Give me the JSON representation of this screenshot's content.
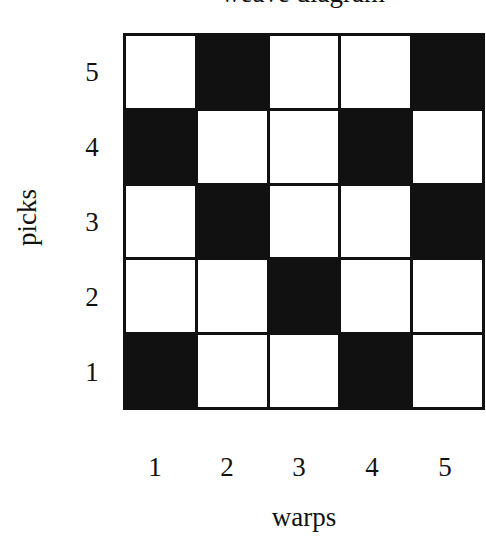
{
  "title": "weave diagram",
  "y_axis": {
    "label": "picks",
    "ticks": [
      "5",
      "4",
      "3",
      "2",
      "1"
    ]
  },
  "x_axis": {
    "label": "warps",
    "ticks": [
      "1",
      "2",
      "3",
      "4",
      "5"
    ]
  },
  "colors": {
    "filled": "#111111",
    "empty": "#ffffff"
  },
  "grid": {
    "rows_top_to_bottom": [
      {
        "pick": "5",
        "cells": [
          0,
          1,
          0,
          0,
          1
        ]
      },
      {
        "pick": "4",
        "cells": [
          1,
          0,
          0,
          1,
          0
        ]
      },
      {
        "pick": "3",
        "cells": [
          0,
          1,
          0,
          0,
          1
        ]
      },
      {
        "pick": "2",
        "cells": [
          0,
          0,
          1,
          0,
          0
        ]
      },
      {
        "pick": "1",
        "cells": [
          1,
          0,
          0,
          1,
          0
        ]
      }
    ]
  }
}
